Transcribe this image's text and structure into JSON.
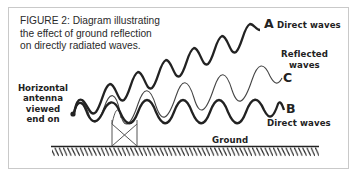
{
  "figure": {
    "caption_lines": [
      "FIGURE 2: Diagram illustrating",
      "the effect of ground reflection",
      "on directly radiated waves."
    ]
  },
  "labels": {
    "wave_a": {
      "letter": "A",
      "text": "Direct waves"
    },
    "wave_b": {
      "letter": "B",
      "text": "Direct waves"
    },
    "wave_c": {
      "letter": "C",
      "text_lines": [
        "Reflected",
        "waves"
      ]
    },
    "antenna_lines": [
      "Horizontal",
      "antenna",
      "viewed",
      "end on"
    ],
    "ground": "Ground"
  },
  "colors": {
    "ink": "#222222",
    "thin_wave": "#444444",
    "frame": "#c9c9c9",
    "background": "#ffffff"
  }
}
